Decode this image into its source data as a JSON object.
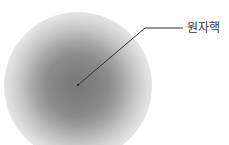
{
  "diagram": {
    "title": "",
    "labels": {
      "nucleus": "원자핵"
    },
    "elements": [
      {
        "type": "electron-cloud",
        "shape": "radial-gradient-circle",
        "center": [
          78,
          85
        ],
        "radius": 74
      },
      {
        "type": "leader-line",
        "from": [
          78,
          85
        ],
        "bend": [
          145,
          28
        ],
        "to": [
          183,
          28
        ],
        "target": "nucleus"
      }
    ],
    "colors": {
      "cloud_core": "#7a7a7a",
      "leader_line": "#333333",
      "label_text": "#333333"
    }
  }
}
